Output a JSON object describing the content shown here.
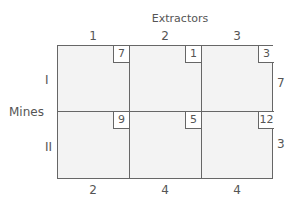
{
  "title": "Extractors",
  "row_axis_label": "Mines",
  "columns": [
    "1",
    "2",
    "3"
  ],
  "rows": [
    "I",
    "II"
  ],
  "costs": [
    [
      "7",
      "1",
      "3"
    ],
    [
      "9",
      "5",
      "12"
    ]
  ],
  "supply": [
    "7",
    "3"
  ],
  "demand": [
    "2",
    "4",
    "4"
  ]
}
